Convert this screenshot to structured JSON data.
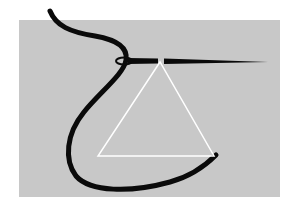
{
  "illustration": {
    "subject": "needle and thread with triangle",
    "colors": {
      "page_background": "#ffffff",
      "panel_background": "#c8c8c8",
      "thread": "#0a0a0a",
      "needle": "#0a0a0a",
      "triangle": "#ffffff"
    }
  }
}
